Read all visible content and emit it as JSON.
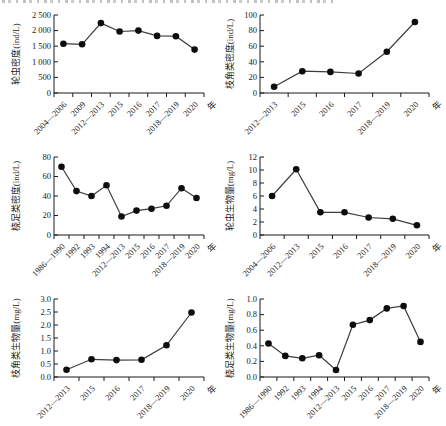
{
  "style": {
    "background": "#ffffff",
    "axis_color": "#1a1a1a",
    "line_color": "#3d3d3d",
    "marker_color": "#0d0d0d",
    "text_color": "#1a1a1a"
  },
  "layout": {
    "grid": false,
    "legend": "none",
    "marker": "filled-circle",
    "x_tick_label_rotation": -45
  },
  "chart_data": [
    {
      "id": "rotifer-density",
      "type": "line",
      "ylabel": "轮虫密度(ind/L)",
      "xlabel": "年",
      "categories": [
        "2004—2006",
        "2009",
        "2012—2013",
        "2015",
        "2016",
        "2017",
        "2018—2019",
        "2020"
      ],
      "values": [
        1580,
        1560,
        2240,
        1970,
        2000,
        1830,
        1820,
        1390
      ],
      "ylim": [
        0,
        2500
      ],
      "ytick_values": [
        0,
        500,
        1000,
        1500,
        2000,
        2500
      ],
      "ytick_labels": [
        "0",
        "500",
        "1 000",
        "1 500",
        "2 000",
        "2 500"
      ]
    },
    {
      "id": "cladocera-density",
      "type": "line",
      "ylabel": "枝角类密度(ind/L)",
      "xlabel": "年",
      "categories": [
        "2012—2013",
        "2015",
        "2016",
        "2017",
        "2018—2019",
        "2020"
      ],
      "values": [
        8,
        28,
        27,
        25,
        53,
        91
      ],
      "ylim": [
        0,
        100
      ],
      "ytick_values": [
        0,
        20,
        40,
        60,
        80,
        100
      ],
      "ytick_labels": [
        "0",
        "20",
        "40",
        "60",
        "80",
        "100"
      ]
    },
    {
      "id": "copepod-density",
      "type": "line",
      "ylabel": "桡足类密度(ind/L)",
      "xlabel": "年",
      "categories": [
        "1986—1990",
        "1992",
        "1993",
        "1994",
        "2012—2013",
        "2015",
        "2016",
        "2017",
        "2018—2019",
        "2020"
      ],
      "values": [
        70,
        45,
        40,
        51,
        19,
        25,
        27,
        30,
        48,
        38
      ],
      "ylim": [
        0,
        80
      ],
      "ytick_values": [
        0,
        20,
        40,
        60,
        80
      ],
      "ytick_labels": [
        "0",
        "20",
        "40",
        "60",
        "80"
      ]
    },
    {
      "id": "rotifer-biomass",
      "type": "line",
      "ylabel": "轮虫生物量(mg/L)",
      "xlabel": "年",
      "categories": [
        "2004—2006",
        "2012—2013",
        "2015",
        "2016",
        "2017",
        "2018—2019",
        "2020"
      ],
      "values": [
        6.0,
        10.1,
        3.5,
        3.5,
        2.7,
        2.5,
        1.5
      ],
      "ylim": [
        0,
        12
      ],
      "ytick_values": [
        0,
        2,
        4,
        6,
        8,
        10,
        12
      ],
      "ytick_labels": [
        "0",
        "2",
        "4",
        "6",
        "8",
        "10",
        "12"
      ]
    },
    {
      "id": "cladocera-biomass",
      "type": "line",
      "ylabel": "枝角类生物量(mg/L)",
      "xlabel": "年",
      "categories": [
        "2012—2013",
        "2015",
        "2016",
        "2017",
        "2018—2019",
        "2020"
      ],
      "values": [
        0.28,
        0.68,
        0.65,
        0.66,
        1.22,
        2.48
      ],
      "ylim": [
        0,
        3
      ],
      "ytick_values": [
        0,
        0.5,
        1.0,
        1.5,
        2.0,
        2.5,
        3.0
      ],
      "ytick_labels": [
        "0.0",
        "0.5",
        "1.0",
        "1.5",
        "2.0",
        "2.5",
        "3.0"
      ]
    },
    {
      "id": "copepod-biomass",
      "type": "line",
      "ylabel": "桡足类生物量(mg/L)",
      "xlabel": "年",
      "categories": [
        "1986—1990",
        "1992",
        "1993",
        "1994",
        "2012—2013",
        "2015",
        "2016",
        "2017",
        "2018—2019",
        "2020"
      ],
      "values": [
        0.43,
        0.27,
        0.24,
        0.28,
        0.09,
        0.67,
        0.73,
        0.88,
        0.91,
        0.45
      ],
      "ylim": [
        0,
        1.0
      ],
      "ytick_values": [
        0,
        0.2,
        0.4,
        0.6,
        0.8,
        1.0
      ],
      "ytick_labels": [
        "0.0",
        "0.2",
        "0.4",
        "0.6",
        "0.8",
        "1.0"
      ]
    }
  ]
}
